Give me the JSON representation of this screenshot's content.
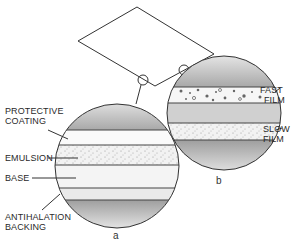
{
  "diagram": {
    "panel_a": {
      "caption": "a",
      "labels": {
        "protective_line1": "PROTECTIVE",
        "protective_line2": "COATING",
        "emulsion": "EMULSION",
        "base": "BASE",
        "antihalation_line1": "ANTIHALATION",
        "antihalation_line2": "BACKING"
      }
    },
    "panel_b": {
      "caption": "b",
      "labels": {
        "fast_line1": "FAST",
        "fast_line2": "FILM",
        "slow_line1": "SLOW",
        "slow_line2": "FILM"
      }
    },
    "colors": {
      "line": "#333333",
      "shade": "#b8b8b8",
      "paper": "#ffffff"
    }
  }
}
